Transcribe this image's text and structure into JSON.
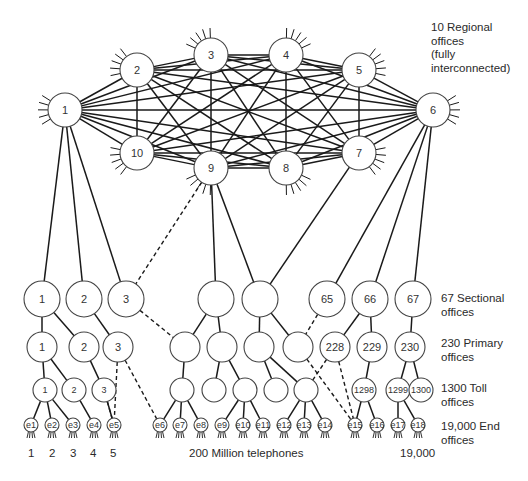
{
  "legend": {
    "regional": "10 Regional\noffices\n(fully\ninterconnected)",
    "sectional": "67 Sectional\noffices",
    "primary": "230 Primary\noffices",
    "toll": "1300 Toll\noffices",
    "end": "19,000 End\noffices"
  },
  "bottom_labels": {
    "end_numbers": [
      "1",
      "2",
      "3",
      "4",
      "5"
    ],
    "telephones": "200 Million telephones",
    "last_end": "19,000"
  },
  "colors": {
    "stroke": "#1a1a1a",
    "text": "#333333",
    "background": "#ffffff"
  },
  "regional_offices": [
    {
      "id": "1",
      "x": 65,
      "y": 110
    },
    {
      "id": "2",
      "x": 137,
      "y": 70
    },
    {
      "id": "3",
      "x": 211,
      "y": 55
    },
    {
      "id": "4",
      "x": 286,
      "y": 55
    },
    {
      "id": "5",
      "x": 359,
      "y": 70
    },
    {
      "id": "6",
      "x": 433,
      "y": 110
    },
    {
      "id": "7",
      "x": 359,
      "y": 153
    },
    {
      "id": "8",
      "x": 286,
      "y": 168
    },
    {
      "id": "9",
      "x": 211,
      "y": 168
    },
    {
      "id": "10",
      "x": 137,
      "y": 153
    }
  ],
  "sectional_offices": [
    {
      "id": "s1",
      "label": "1",
      "x": 42,
      "y": 299
    },
    {
      "id": "s2",
      "label": "2",
      "x": 84,
      "y": 299
    },
    {
      "id": "s3",
      "label": "3",
      "x": 126,
      "y": 299
    },
    {
      "id": "sA",
      "label": "",
      "x": 216,
      "y": 299
    },
    {
      "id": "sB",
      "label": "",
      "x": 260,
      "y": 299
    },
    {
      "id": "s65",
      "label": "65",
      "x": 327,
      "y": 299
    },
    {
      "id": "s66",
      "label": "66",
      "x": 370,
      "y": 299
    },
    {
      "id": "s67",
      "label": "67",
      "x": 413,
      "y": 299
    }
  ],
  "primary_offices": [
    {
      "id": "p1",
      "label": "1",
      "x": 42,
      "y": 347
    },
    {
      "id": "p2",
      "label": "2",
      "x": 84,
      "y": 347
    },
    {
      "id": "p3",
      "label": "3",
      "x": 118,
      "y": 347
    },
    {
      "id": "p4",
      "label": "",
      "x": 185,
      "y": 347
    },
    {
      "id": "p5",
      "label": "",
      "x": 222,
      "y": 347
    },
    {
      "id": "p6",
      "label": "",
      "x": 259,
      "y": 347
    },
    {
      "id": "p7",
      "label": "",
      "x": 298,
      "y": 347
    },
    {
      "id": "p228",
      "label": "228",
      "x": 335,
      "y": 347
    },
    {
      "id": "p229",
      "label": "229",
      "x": 372,
      "y": 347
    },
    {
      "id": "p230",
      "label": "230",
      "x": 410,
      "y": 347
    }
  ],
  "toll_offices": [
    {
      "id": "t1",
      "label": "1",
      "x": 45,
      "y": 390
    },
    {
      "id": "t2",
      "label": "2",
      "x": 74,
      "y": 390
    },
    {
      "id": "t3",
      "label": "3",
      "x": 104,
      "y": 390
    },
    {
      "id": "t4",
      "label": "",
      "x": 182,
      "y": 390
    },
    {
      "id": "t5",
      "label": "",
      "x": 214,
      "y": 390
    },
    {
      "id": "t6",
      "label": "",
      "x": 245,
      "y": 390
    },
    {
      "id": "t7",
      "label": "",
      "x": 276,
      "y": 390
    },
    {
      "id": "t8",
      "label": "",
      "x": 306,
      "y": 390
    },
    {
      "id": "t1298",
      "label": "1298",
      "x": 364,
      "y": 390
    },
    {
      "id": "t1299",
      "label": "1299",
      "x": 398,
      "y": 390
    },
    {
      "id": "t1300",
      "label": "1300",
      "x": 421,
      "y": 390
    }
  ],
  "end_offices": [
    {
      "id": "e1",
      "x": 31,
      "y": 425
    },
    {
      "id": "e2",
      "x": 52,
      "y": 425
    },
    {
      "id": "e3",
      "x": 73,
      "y": 425
    },
    {
      "id": "e4",
      "x": 94,
      "y": 425
    },
    {
      "id": "e5",
      "x": 114,
      "y": 425
    },
    {
      "id": "e6",
      "x": 160,
      "y": 425
    },
    {
      "id": "e7",
      "x": 180,
      "y": 425
    },
    {
      "id": "e8",
      "x": 201,
      "y": 425
    },
    {
      "id": "e9",
      "x": 222,
      "y": 425
    },
    {
      "id": "e10",
      "x": 243,
      "y": 425
    },
    {
      "id": "e11",
      "x": 263,
      "y": 425
    },
    {
      "id": "e12",
      "x": 284,
      "y": 425
    },
    {
      "id": "e13",
      "x": 304,
      "y": 425
    },
    {
      "id": "e14",
      "x": 325,
      "y": 425
    },
    {
      "id": "e15",
      "x": 355,
      "y": 425
    },
    {
      "id": "e16",
      "x": 377,
      "y": 425
    },
    {
      "id": "e17",
      "x": 398,
      "y": 425
    },
    {
      "id": "e18",
      "x": 418,
      "y": 425
    }
  ],
  "links_solid": [
    [
      "r1",
      "s1"
    ],
    [
      "r1",
      "s2"
    ],
    [
      "r1",
      "s3"
    ],
    [
      "r9",
      "sA"
    ],
    [
      "r9",
      "sB"
    ],
    [
      "r7",
      "sB"
    ],
    [
      "r6",
      "s65"
    ],
    [
      "r6",
      "s66"
    ],
    [
      "r6",
      "s67"
    ],
    [
      "s1",
      "p1"
    ],
    [
      "s1",
      "p2"
    ],
    [
      "s2",
      "p3"
    ],
    [
      "sA",
      "p4"
    ],
    [
      "sA",
      "p5"
    ],
    [
      "sB",
      "p6"
    ],
    [
      "sB",
      "p7"
    ],
    [
      "s66",
      "p228"
    ],
    [
      "s66",
      "p229"
    ],
    [
      "s67",
      "p230"
    ],
    [
      "p1",
      "t1"
    ],
    [
      "p1",
      "t2"
    ],
    [
      "p2",
      "t3"
    ],
    [
      "p4",
      "t4"
    ],
    [
      "p5",
      "t5"
    ],
    [
      "p5",
      "t6"
    ],
    [
      "p6",
      "t7"
    ],
    [
      "p6",
      "t8"
    ],
    [
      "p229",
      "t1298"
    ],
    [
      "p230",
      "t1299"
    ],
    [
      "p230",
      "t1300"
    ],
    [
      "t1",
      "e1"
    ],
    [
      "t1",
      "e2"
    ],
    [
      "t1",
      "e3"
    ],
    [
      "t2",
      "e4"
    ],
    [
      "t3",
      "e5"
    ],
    [
      "t4",
      "e6"
    ],
    [
      "t4",
      "e7"
    ],
    [
      "t4",
      "e8"
    ],
    [
      "t6",
      "e9"
    ],
    [
      "t6",
      "e10"
    ],
    [
      "t6",
      "e11"
    ],
    [
      "t8",
      "e12"
    ],
    [
      "t8",
      "e13"
    ],
    [
      "t8",
      "e14"
    ],
    [
      "t1298",
      "e15"
    ],
    [
      "t1298",
      "e16"
    ],
    [
      "t1299",
      "e17"
    ],
    [
      "t1299",
      "e18"
    ]
  ],
  "links_dashed": [
    [
      "r9",
      "s3"
    ],
    [
      "s3",
      "p4"
    ],
    [
      "s65",
      "p7"
    ],
    [
      "p3",
      "e5"
    ],
    [
      "t3",
      "e5"
    ],
    [
      "p3",
      "e6"
    ],
    [
      "p228",
      "t8"
    ],
    [
      "p228",
      "e15"
    ],
    [
      "p7",
      "e15"
    ]
  ]
}
